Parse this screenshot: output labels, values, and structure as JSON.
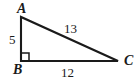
{
  "figure": {
    "kind": "right-triangle-diagram",
    "background_color": "#ffffff",
    "stroke_color": "#1a1a1a",
    "text_color": "#1a1a1a",
    "vertices": {
      "A": {
        "label": "A",
        "x": 21,
        "y": 17
      },
      "B": {
        "label": "B",
        "x": 21,
        "y": 61
      },
      "C": {
        "label": "C",
        "x": 118,
        "y": 61
      }
    },
    "sides": [
      {
        "name": "AB",
        "label": "5",
        "role": "vertical-leg"
      },
      {
        "name": "AC",
        "label": "13",
        "role": "hypotenuse"
      },
      {
        "name": "BC",
        "label": "12",
        "role": "horizontal-leg"
      }
    ],
    "right_angle": {
      "at": "B",
      "marker": "square",
      "size": 8
    }
  }
}
